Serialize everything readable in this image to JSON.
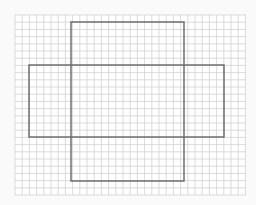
{
  "diagram": {
    "type": "net-on-grid-paper",
    "grid": {
      "x0": 15,
      "y0": 15,
      "x1": 246,
      "y1": 195,
      "cell": 7.2,
      "line_color": "#d2d2d2"
    },
    "shapes": [
      {
        "name": "vertical-rectangle",
        "x": 71,
        "y": 22,
        "w": 113,
        "h": 159
      },
      {
        "name": "horizontal-rectangle",
        "x": 29,
        "y": 65,
        "w": 195,
        "h": 72
      }
    ],
    "stroke_color": "#666666",
    "background": "#ffffff"
  }
}
